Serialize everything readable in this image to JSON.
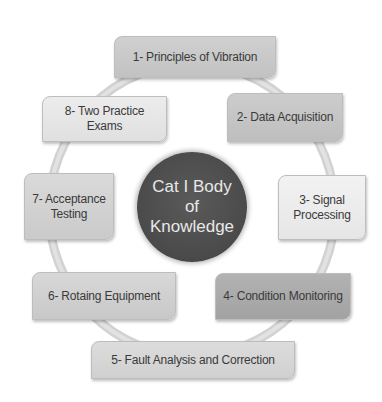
{
  "diagram": {
    "type": "cycle",
    "center": {
      "label": "Cat I Body of Knowledge",
      "color": "#4d4d4d",
      "text_color": "#e8e8e8"
    },
    "ring_color": "#d4d4d4",
    "nodes": [
      {
        "id": 1,
        "label": "1-  Principles of Vibration",
        "color": "#c8c8c8"
      },
      {
        "id": 2,
        "label": "2- Data Acquisition",
        "color": "#c4c4c4"
      },
      {
        "id": 3,
        "label": "3- Signal Processing",
        "color": "#ececec"
      },
      {
        "id": 4,
        "label": "4- Condition Monitoring",
        "color": "#aaaaaa"
      },
      {
        "id": 5,
        "label": "5- Fault Analysis and Correction",
        "color": "#d6d6d6"
      },
      {
        "id": 6,
        "label": "6- Rotaing Equipment",
        "color": "#d0d0d0"
      },
      {
        "id": 7,
        "label": "7- Acceptance Testing",
        "color": "#d2d2d2"
      },
      {
        "id": 8,
        "label": "8- Two Practice Exams",
        "color": "#e6e6e6"
      }
    ]
  }
}
